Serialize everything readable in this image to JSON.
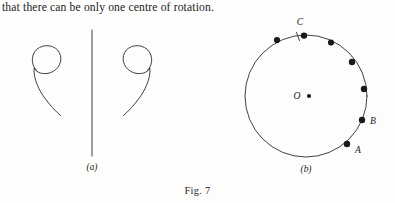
{
  "document": {
    "body_text": "that there can be only one centre of rotation.",
    "figure_caption": "Fig. 7"
  },
  "figure_a": {
    "sublabel": "(a)",
    "description": "two mirror-image spiral curves flanking a vertical line",
    "vertical_line": {
      "x": 92,
      "y_top": 30,
      "y_bottom": 156
    },
    "left_spiral": {
      "loop_cx": 46,
      "loop_cy": 61,
      "loop_r": 15
    },
    "right_spiral": {
      "loop_cx": 131,
      "loop_cy": 61,
      "loop_r": 15
    }
  },
  "figure_b": {
    "sublabel": "(b)",
    "center_label": "O",
    "circle": {
      "cx": 306,
      "cy": 96,
      "r": 61
    },
    "point_labels": [
      {
        "name": "A",
        "x": 352,
        "y": 145
      },
      {
        "name": "B",
        "x": 363,
        "y": 127
      },
      {
        "name": "C",
        "x": 303,
        "y": 27
      }
    ],
    "tick_mark": {
      "x": 298,
      "y": 35,
      "length": 8
    },
    "dots": [
      {
        "id": "dot-1",
        "cx": 277,
        "cy": 40
      },
      {
        "id": "dot-2",
        "cx": 303,
        "cy": 36
      },
      {
        "id": "dot-3",
        "cx": 331,
        "cy": 42
      },
      {
        "id": "dot-4",
        "cx": 352,
        "cy": 62
      },
      {
        "id": "dot-5",
        "cx": 364,
        "cy": 89
      },
      {
        "id": "dot-6",
        "cx": 363,
        "cy": 120
      },
      {
        "id": "dot-7",
        "cx": 348,
        "cy": 144
      }
    ]
  },
  "colors": {
    "ink": "#232323",
    "stroke": "#2b2b2b",
    "dot": "#1a1a1a",
    "background": "#fdfdfc"
  }
}
